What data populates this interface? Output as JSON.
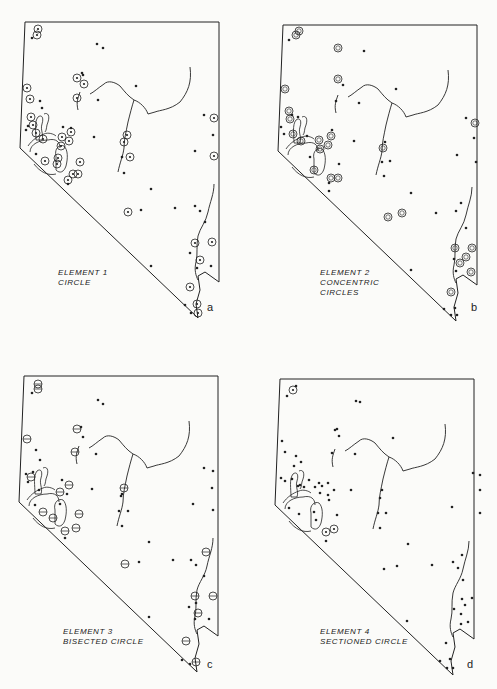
{
  "figure": {
    "colors": {
      "ink": "#222222",
      "paper": "#fbfbf9"
    },
    "panels": [
      {
        "id": "a",
        "letter": "a",
        "label_line1": "ELEMENT 1",
        "label_line2": "CIRCLE",
        "label_line3": "",
        "symbol": "circle"
      },
      {
        "id": "b",
        "letter": "b",
        "label_line1": "ELEMENT 2",
        "label_line2": "CONCENTRIC",
        "label_line3": "CIRCLES",
        "symbol": "concentric-circles"
      },
      {
        "id": "c",
        "letter": "c",
        "label_line1": "ELEMENT 3",
        "label_line2": "BISECTED CIRCLE",
        "label_line3": "",
        "symbol": "bisected-circle"
      },
      {
        "id": "d",
        "letter": "d",
        "label_line1": "ELEMENT 4",
        "label_line2": "SECTIONED CIRCLE",
        "label_line3": "",
        "symbol": "sectioned-circle"
      }
    ]
  }
}
